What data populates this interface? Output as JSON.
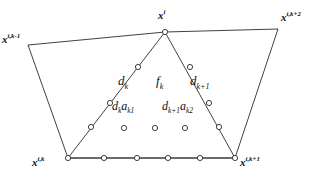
{
  "figure": {
    "width": 324,
    "height": 184,
    "background": "#ffffff",
    "stroke_color": "#2b2b2b",
    "marker_fill": "#ffffff",
    "text_color": "#111111"
  },
  "vertices": [
    {
      "id": "x-i-k-minus-1",
      "base": "x",
      "superscript": "i,k-1",
      "x": 28,
      "y": 45,
      "label_x": 2,
      "label_y": 34,
      "show_marker": false
    },
    {
      "id": "x-i",
      "base": "x",
      "superscript": "i",
      "x": 165,
      "y": 32,
      "label_x": 158,
      "label_y": 10,
      "show_marker": true
    },
    {
      "id": "x-i-k-plus-2",
      "base": "x",
      "superscript": "i,k+2",
      "x": 278,
      "y": 29,
      "label_x": 281,
      "label_y": 12,
      "show_marker": false
    },
    {
      "id": "x-i-k-plus-1",
      "base": "x",
      "superscript": "i,k+1",
      "x": 235,
      "y": 158,
      "label_x": 240,
      "label_y": 157,
      "show_marker": true
    },
    {
      "id": "x-i-k",
      "base": "x",
      "superscript": "i,k",
      "x": 68,
      "y": 158,
      "label_x": 32,
      "label_y": 157,
      "show_marker": true
    }
  ],
  "outer_polygon": {
    "name": "outer-quadrilateral",
    "points": "28,45 165,32 278,29 235,158 68,158",
    "closed": true
  },
  "inner_fan": {
    "name": "inner-triangle-fan",
    "left_leg": {
      "from": [
        165,
        32
      ],
      "to": [
        68,
        158
      ]
    },
    "right_leg": {
      "from": [
        165,
        32
      ],
      "to": [
        235,
        158
      ]
    },
    "base": {
      "from": [
        68,
        158
      ],
      "to": [
        235,
        158
      ]
    }
  },
  "markers": {
    "radius": 2.6,
    "left_leg": [
      {
        "x": 138,
        "y": 67
      },
      {
        "x": 110,
        "y": 103
      },
      {
        "x": 91,
        "y": 127
      }
    ],
    "right_leg": [
      {
        "x": 190,
        "y": 67
      },
      {
        "x": 209,
        "y": 103
      },
      {
        "x": 219,
        "y": 127
      }
    ],
    "base_row": [
      {
        "x": 104,
        "y": 158
      },
      {
        "x": 137,
        "y": 158
      },
      {
        "x": 168,
        "y": 158
      },
      {
        "x": 200,
        "y": 158
      }
    ],
    "middle_row": [
      {
        "x": 124,
        "y": 128
      },
      {
        "x": 155,
        "y": 128
      },
      {
        "x": 185,
        "y": 128
      }
    ]
  },
  "annotations": [
    {
      "id": "label-dk",
      "base": "d",
      "sub": "k",
      "sub2": "",
      "x": 118,
      "y": 74,
      "size": "ann-lbl"
    },
    {
      "id": "label-fk",
      "base": "f",
      "sub": "k",
      "sub2": "",
      "x": 156,
      "y": 74,
      "size": "ann-lbl"
    },
    {
      "id": "label-dk1",
      "base": "d",
      "sub": "k+1",
      "sub2": "",
      "x": 190,
      "y": 74,
      "size": "ann-lbl"
    },
    {
      "id": "label-dk-ak1",
      "base": "d",
      "sub": "k",
      "sub2": "a",
      "sub3": "k1",
      "x": 112,
      "y": 100,
      "size": "ann-lbl-sm"
    },
    {
      "id": "label-dk1-ak2",
      "base": "d",
      "sub": "k+1",
      "sub2": "a",
      "sub3": "k2",
      "x": 162,
      "y": 100,
      "size": "ann-lbl-sm"
    }
  ],
  "text": {
    "dk": "d",
    "dk_sub": "k",
    "fk": "f",
    "fk_sub": "k",
    "dk1": "d",
    "dk1_sub": "k+1",
    "a": "a",
    "ak1_sub": "k1",
    "ak2_sub": "k2",
    "x": "x",
    "sup_ikm1": "i,k-1",
    "sup_i": "i",
    "sup_ikp2": "i,k+2",
    "sup_ikp1": "i,k+1",
    "sup_ik": "i,k"
  }
}
